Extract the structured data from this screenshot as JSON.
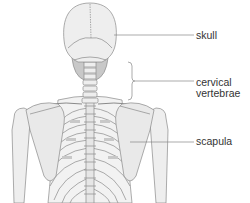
{
  "diagram": {
    "labels": [
      {
        "id": "skull",
        "text": "skull"
      },
      {
        "id": "cervical",
        "line1": "cervical",
        "line2": "vertebrae"
      },
      {
        "id": "scapula",
        "text": "scapula"
      }
    ]
  },
  "colors": {
    "bone_fill": "#eeeeee",
    "bone_stroke": "#8a8a8a",
    "shade": "#c8c8c8",
    "leader_line": "#888888",
    "text": "#333333",
    "background": "#ffffff"
  }
}
